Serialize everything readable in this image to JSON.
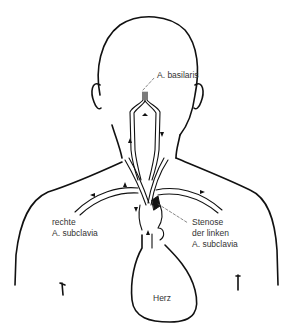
{
  "figure": {
    "type": "anatomical-line-drawing",
    "labels": {
      "basilaris": "A. basilaris",
      "right_subclavia_line1": "rechte",
      "right_subclavia_line2": "A. subclavia",
      "stenosis_line1": "Stenose",
      "stenosis_line2": "der linken",
      "stenosis_line3": "A. subclavia",
      "heart": "Herz"
    },
    "colors": {
      "line": "#111111",
      "text": "#333333",
      "background": "#ffffff"
    }
  }
}
